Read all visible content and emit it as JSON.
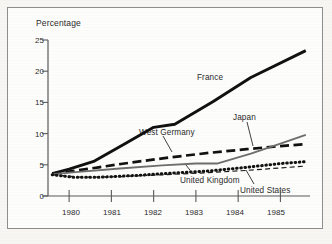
{
  "chart_data": {
    "type": "line",
    "title": "",
    "xlabel": "",
    "ylabel": "Percentage",
    "xlim": [
      1979.5,
      1985.7
    ],
    "ylim": [
      0,
      25
    ],
    "grid": false,
    "legend_position": "inline-annotations",
    "x_ticks": [
      "1980",
      "1981",
      "1982",
      "1983",
      "1984",
      "1985"
    ],
    "x_tick_values": [
      1980,
      1981,
      1982,
      1983,
      1984,
      1985
    ],
    "y_ticks": [
      "0",
      "5",
      "10",
      "15",
      "20",
      "25"
    ],
    "y_tick_values": [
      0,
      5,
      10,
      15,
      20,
      25
    ],
    "series": [
      {
        "name": "France",
        "style": "solid-thick-black",
        "color": "#111111",
        "x": [
          1979.6,
          1980.0,
          1980.6,
          1981.3,
          1982.0,
          1982.5,
          1983.4,
          1984.3,
          1985.6
        ],
        "values": [
          3.6,
          4.3,
          5.6,
          8.3,
          11.0,
          11.5,
          15.1,
          19.0,
          23.3
        ]
      },
      {
        "name": "West Germany",
        "style": "dashed-thick-black",
        "color": "#111111",
        "x": [
          1979.6,
          1980.0,
          1980.7,
          1981.5,
          1982.4,
          1983.3,
          1984.2,
          1985.0,
          1985.6
        ],
        "values": [
          3.6,
          3.9,
          4.6,
          5.4,
          6.2,
          6.9,
          7.5,
          8.0,
          8.3
        ]
      },
      {
        "name": "Japan",
        "style": "solid-thin-gray",
        "color": "#6e6e6e",
        "x": [
          1979.6,
          1980.3,
          1981.2,
          1982.2,
          1983.0,
          1983.5,
          1984.3,
          1985.0,
          1985.6
        ],
        "values": [
          3.5,
          3.9,
          4.4,
          4.9,
          5.2,
          5.2,
          6.8,
          8.4,
          9.8
        ]
      },
      {
        "name": "United Kingdom",
        "style": "dotted-thick-black",
        "color": "#111111",
        "x": [
          1979.6,
          1980.1,
          1980.7,
          1981.6,
          1982.5,
          1983.3,
          1984.2,
          1985.0,
          1985.6
        ],
        "values": [
          3.4,
          3.0,
          3.0,
          3.3,
          3.7,
          4.0,
          4.6,
          5.2,
          5.5
        ]
      },
      {
        "name": "United States",
        "style": "dashed-thin-black",
        "color": "#1a1a1a",
        "x": [
          1979.6,
          1980.3,
          1981.2,
          1982.2,
          1983.2,
          1984.2,
          1985.0,
          1985.6
        ],
        "values": [
          3.4,
          3.0,
          3.1,
          3.4,
          3.7,
          4.1,
          4.5,
          4.8
        ]
      }
    ],
    "annotations": [
      {
        "label": "France",
        "x_px": 197,
        "y_px": 79
      },
      {
        "label": "West Germany",
        "x_px": 163,
        "y_px": 134
      },
      {
        "label": "Japan",
        "x_px": 235,
        "y_px": 119
      },
      {
        "label": "United Kingdom",
        "x_px": 182,
        "y_px": 180
      },
      {
        "label": "United States",
        "x_px": 243,
        "y_px": 190
      }
    ]
  },
  "axes": {
    "y_axis_title": "Percentage"
  }
}
